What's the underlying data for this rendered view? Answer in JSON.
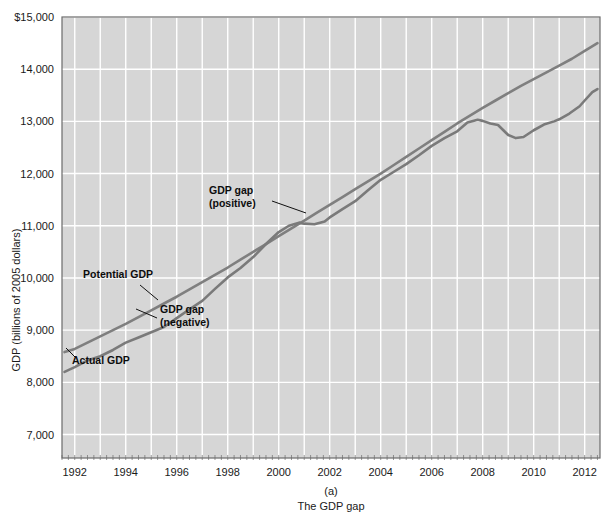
{
  "chart_data": {
    "type": "line",
    "title": "",
    "caption_label": "(a)",
    "caption_text": "The GDP gap",
    "xlabel": "",
    "ylabel": "GDP (billions of 2005 dollars)",
    "xlim": [
      1991.5,
      2012.6
    ],
    "ylim": [
      6550,
      15000
    ],
    "ytick_labels": [
      "$15,000",
      "14,000",
      "13,000",
      "12,000",
      "11,000",
      "10,000",
      "9,000",
      "8,000",
      "7,000"
    ],
    "ytick_values": [
      15000,
      14000,
      13000,
      12000,
      11000,
      10000,
      9000,
      8000,
      7000
    ],
    "xtick_labels": [
      "1992",
      "1994",
      "1996",
      "1998",
      "2000",
      "2002",
      "2004",
      "2006",
      "2008",
      "2010",
      "2012"
    ],
    "xtick_values": [
      1992,
      1994,
      1996,
      1998,
      2000,
      2002,
      2004,
      2006,
      2008,
      2010,
      2012
    ],
    "grid": true,
    "grid_color": "#ffffff",
    "plot_bg": "#d6d6d6",
    "legend_position": "none",
    "line_color": "#7a7a7a",
    "series": [
      {
        "name": "Potential GDP",
        "color": "#7f7f7f",
        "x": [
          1991.6,
          1992,
          1992.5,
          1993,
          1993.5,
          1994,
          1994.5,
          1995,
          1995.5,
          1996,
          1996.5,
          1997,
          1997.5,
          1998,
          1998.5,
          1999,
          1999.5,
          2000,
          2000.5,
          2001,
          2001.5,
          2002,
          2002.5,
          2003,
          2003.5,
          2004,
          2004.5,
          2005,
          2005.5,
          2006,
          2006.5,
          2007,
          2007.5,
          2008,
          2008.5,
          2009,
          2009.5,
          2010,
          2010.5,
          2011,
          2011.5,
          2012,
          2012.5
        ],
        "values": [
          8580,
          8640,
          8760,
          8880,
          9000,
          9120,
          9250,
          9380,
          9510,
          9640,
          9780,
          9920,
          10060,
          10200,
          10350,
          10500,
          10650,
          10800,
          10950,
          11100,
          11250,
          11400,
          11550,
          11700,
          11850,
          12000,
          12160,
          12320,
          12480,
          12640,
          12800,
          12960,
          13110,
          13260,
          13400,
          13540,
          13680,
          13810,
          13940,
          14070,
          14200,
          14350,
          14500
        ]
      },
      {
        "name": "Actual GDP",
        "color": "#7a7a7a",
        "x": [
          1991.6,
          1992,
          1992.5,
          1993,
          1993.5,
          1994,
          1994.5,
          1995,
          1995.5,
          1996,
          1996.5,
          1997,
          1997.5,
          1998,
          1998.5,
          1999,
          1999.5,
          2000,
          2000.4,
          2000.8,
          2001,
          2001.4,
          2001.8,
          2002,
          2002.5,
          2003,
          2003.5,
          2004,
          2004.5,
          2005,
          2005.5,
          2006,
          2006.5,
          2007,
          2007.4,
          2007.8,
          2008,
          2008.3,
          2008.6,
          2009,
          2009.3,
          2009.6,
          2010,
          2010.4,
          2010.8,
          2011,
          2011.4,
          2011.8,
          2012,
          2012.3,
          2012.5
        ],
        "values": [
          8200,
          8290,
          8420,
          8500,
          8620,
          8760,
          8860,
          8960,
          9060,
          9230,
          9400,
          9560,
          9790,
          10010,
          10190,
          10400,
          10650,
          10880,
          11000,
          11060,
          11040,
          11030,
          11080,
          11160,
          11320,
          11470,
          11680,
          11880,
          12030,
          12180,
          12350,
          12530,
          12680,
          12810,
          12980,
          13030,
          13010,
          12960,
          12930,
          12740,
          12680,
          12700,
          12830,
          12940,
          13000,
          13040,
          13150,
          13290,
          13400,
          13560,
          13620
        ]
      }
    ],
    "annotations": [
      {
        "id": "gdp-gap-positive",
        "lines": [
          "GDP gap",
          "(positive)"
        ],
        "x": 209,
        "y": 194,
        "leader": [
          [
            272,
            201
          ],
          [
            306,
            213
          ]
        ]
      },
      {
        "id": "potential-gdp",
        "lines": [
          "Potential GDP"
        ],
        "x": 83,
        "y": 278,
        "leader": [
          [
            140,
            285
          ],
          [
            158,
            300
          ]
        ]
      },
      {
        "id": "gdp-gap-negative",
        "lines": [
          "GDP gap",
          "(negative)"
        ],
        "x": 160,
        "y": 313,
        "leader": [
          [
            157,
            318
          ],
          [
            136,
            309
          ]
        ]
      },
      {
        "id": "actual-gdp",
        "lines": [
          "Actual GDP"
        ],
        "x": 72,
        "y": 364,
        "leader": [
          [
            76,
            358
          ],
          [
            66,
            348
          ]
        ]
      }
    ]
  }
}
